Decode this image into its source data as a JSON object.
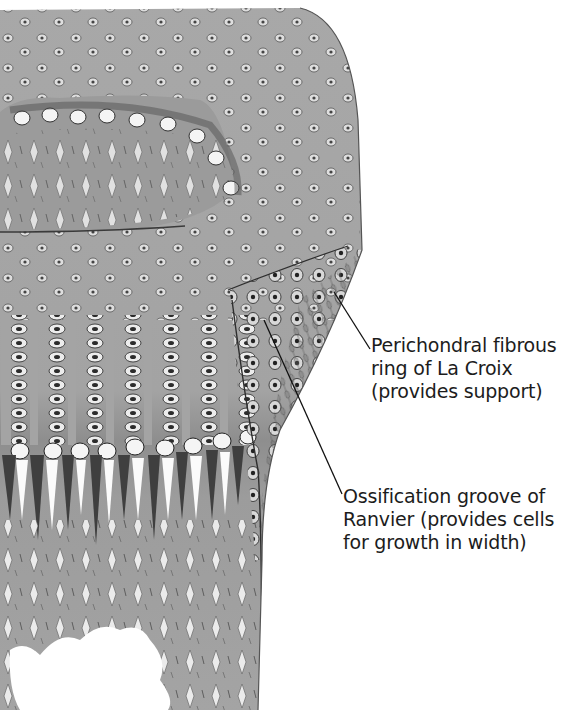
{
  "figure": {
    "colors": {
      "cartilage": "#a9a9a9",
      "cell_dark": "#3a3a3a",
      "cell_light": "#f2f2f2",
      "ring": "#9e9e9e",
      "background": "#ffffff",
      "line": "#111111"
    }
  },
  "labels": [
    {
      "id": "perichondral-ring",
      "lines": [
        "Perichondral fibrous",
        "ring of La Croix",
        "(provides support)"
      ]
    },
    {
      "id": "ossification-groove",
      "lines": [
        "Ossification groove of",
        "Ranvier (provides cells",
        "for growth in width)"
      ]
    }
  ]
}
